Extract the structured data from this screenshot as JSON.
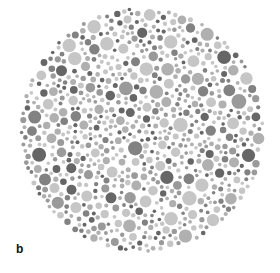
{
  "figure": {
    "panel_label": "b",
    "plate": {
      "type": "color-vision-test-plate",
      "center": [
        142,
        130
      ],
      "radius": 123,
      "seed": 7,
      "dot_count": 1400,
      "min_r": 1.8,
      "max_r": 7.5,
      "colors": {
        "background": "#ffffff",
        "light": "#c6c6c6",
        "mid_light": "#b0b0b0",
        "mid": "#9a9a9a",
        "mid_dark": "#828282",
        "dark": "#666666"
      }
    }
  }
}
